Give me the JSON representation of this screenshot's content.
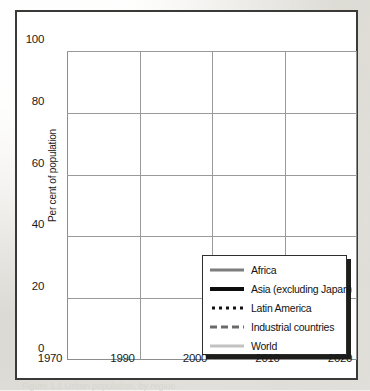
{
  "figure": {
    "caption": "Figure 1.1 Urban population, by region"
  },
  "chart_data": {
    "type": "line",
    "title": "",
    "xlabel": "",
    "ylabel": "Per cent of population",
    "xlim": [
      1970,
      2020
    ],
    "ylim": [
      0,
      100
    ],
    "grid": true,
    "x_ticks": [
      "1970",
      "1990",
      "2000",
      "2010",
      "2020"
    ],
    "x_tick_values": [
      1970,
      1990,
      2000,
      2010,
      2020
    ],
    "y_ticks": [
      "0",
      "20",
      "40",
      "60",
      "80",
      "100"
    ],
    "y_tick_values": [
      0,
      20,
      40,
      60,
      80,
      100
    ],
    "legend_position": "lower-right",
    "x": [
      1970,
      1990,
      2000,
      2010,
      2020
    ],
    "series": [
      {
        "name": "Africa",
        "style": "solid",
        "color": "#7d7d7d",
        "width": 2.6,
        "values": [
          22,
          34,
          39,
          46,
          55
        ]
      },
      {
        "name": "Asia (excluding Japan)",
        "style": "solid",
        "color": "#0d0d0d",
        "width": 3.0,
        "values": [
          20,
          33,
          39,
          47,
          57
        ]
      },
      {
        "name": "Latin America",
        "style": "dotted",
        "color": "#111111",
        "width": 3.0,
        "values": [
          58,
          73,
          77,
          80,
          83
        ]
      },
      {
        "name": "Industrial countries",
        "style": "dashed",
        "color": "#6a6a6a",
        "width": 3.0,
        "values": [
          66,
          75,
          76,
          78,
          80
        ]
      },
      {
        "name": "World",
        "style": "solid",
        "color": "#c2c2c2",
        "width": 2.6,
        "values": [
          38,
          45,
          52,
          58,
          62
        ]
      }
    ]
  }
}
